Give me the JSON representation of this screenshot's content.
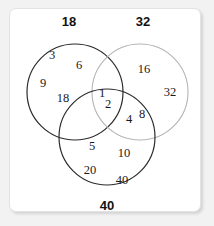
{
  "figure": {
    "name": "venn-diagram-factors",
    "top_clipped_text": "",
    "background_color": "#f2f2f2",
    "panel_color": "#ffffff",
    "panel_border_color": "#e3e3e3",
    "text_color": "#1a1a1a"
  },
  "circles": {
    "left": {
      "label": "18",
      "stroke": "#2b2b2b",
      "cx": 75,
      "cy": 92,
      "r": 48
    },
    "right": {
      "label": "32",
      "stroke": "#b0b0b0",
      "cx": 140,
      "cy": 92,
      "r": 48
    },
    "bottom": {
      "label": "40",
      "stroke": "#2b2b2b",
      "cx": 107,
      "cy": 137,
      "r": 48
    }
  },
  "labels": {
    "left_set": "18",
    "right_set": "32",
    "bottom_set": "40"
  },
  "regions": {
    "left_only": [
      "3",
      "6",
      "9",
      "18"
    ],
    "right_only": [
      "16",
      "32"
    ],
    "bottom_only": [
      "5",
      "10",
      "20",
      "40"
    ],
    "left_and_right_only": [],
    "left_and_bottom_only": [],
    "right_and_bottom_only": [
      "4",
      "8"
    ],
    "all_three": [
      "1",
      "2"
    ]
  },
  "items": [
    {
      "id": "n-3",
      "text": "3",
      "x": 52,
      "y": 55,
      "region": "left_only"
    },
    {
      "id": "n-6",
      "text": "6",
      "x": 79,
      "y": 65,
      "region": "left_only"
    },
    {
      "id": "n-9",
      "text": "9",
      "x": 43,
      "y": 83,
      "region": "left_only"
    },
    {
      "id": "n-18",
      "text": "18",
      "x": 63,
      "y": 98,
      "region": "left_only"
    },
    {
      "id": "n-16",
      "text": "16",
      "x": 144,
      "y": 69,
      "region": "right_only"
    },
    {
      "id": "n-32",
      "text": "32",
      "x": 170,
      "y": 92,
      "region": "right_only"
    },
    {
      "id": "n-1",
      "text": "1",
      "x": 102,
      "y": 93,
      "region": "all_three"
    },
    {
      "id": "n-2",
      "text": "2",
      "x": 108,
      "y": 104,
      "region": "all_three"
    },
    {
      "id": "n-4",
      "text": "4",
      "x": 129,
      "y": 119,
      "region": "right_and_bottom_only"
    },
    {
      "id": "n-8",
      "text": "8",
      "x": 142,
      "y": 114,
      "region": "right_and_bottom_only"
    },
    {
      "id": "n-5",
      "text": "5",
      "x": 92,
      "y": 146,
      "region": "bottom_only"
    },
    {
      "id": "n-10",
      "text": "10",
      "x": 124,
      "y": 153,
      "region": "bottom_only"
    },
    {
      "id": "n-20",
      "text": "20",
      "x": 90,
      "y": 170,
      "region": "bottom_only"
    },
    {
      "id": "n-40",
      "text": "40",
      "x": 122,
      "y": 180,
      "region": "bottom_only"
    }
  ],
  "label_positions": {
    "left_set": {
      "x": 69,
      "y": 21
    },
    "right_set": {
      "x": 143,
      "y": 21
    },
    "bottom_set": {
      "x": 107,
      "y": 205
    }
  }
}
